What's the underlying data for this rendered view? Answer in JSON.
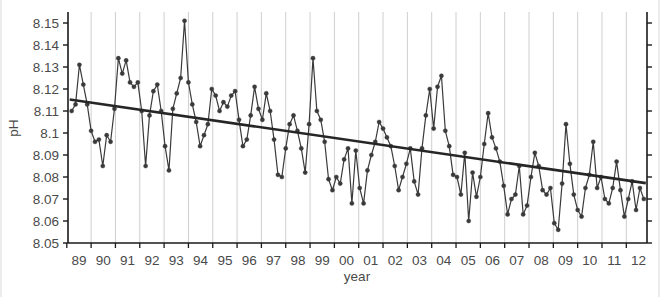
{
  "chart_data": {
    "type": "line",
    "title": "",
    "subtitle": "",
    "xlabel": "year",
    "ylabel": "pH",
    "grid": "vertical-only",
    "legend": "none",
    "xlim": [
      1988.55,
      2012.35
    ],
    "ylim": [
      8.05,
      8.155
    ],
    "ytick_labels": [
      "8.15",
      "8.14",
      "8.13",
      "8.12",
      "8.11",
      "8.1",
      "8.09",
      "8.08",
      "8.07",
      "8.06",
      "8.05"
    ],
    "ytick_values": [
      8.15,
      8.14,
      8.13,
      8.12,
      8.11,
      8.1,
      8.09,
      8.08,
      8.07,
      8.06,
      8.05
    ],
    "xtick_labels": [
      "89",
      "90",
      "91",
      "92",
      "93",
      "94",
      "95",
      "96",
      "97",
      "98",
      "99",
      "00",
      "01",
      "02",
      "03",
      "04",
      "05",
      "06",
      "07",
      "08",
      "09",
      "10",
      "11",
      "12"
    ],
    "xtick_values": [
      1989,
      1990,
      1991,
      1992,
      1993,
      1994,
      1995,
      1996,
      1997,
      1998,
      1999,
      2000,
      2001,
      2002,
      2003,
      2004,
      2005,
      2006,
      2007,
      2008,
      2009,
      2010,
      2011,
      2012
    ],
    "series": [
      {
        "name": "pH",
        "marker": "filled-circle",
        "color": "#3a3a3a",
        "x": [
          1988.7,
          1988.86,
          1989.02,
          1989.18,
          1989.34,
          1989.5,
          1989.66,
          1989.82,
          1989.98,
          1990.14,
          1990.3,
          1990.46,
          1990.62,
          1990.78,
          1990.94,
          1991.1,
          1991.26,
          1991.42,
          1991.58,
          1991.74,
          1991.9,
          1992.06,
          1992.22,
          1992.38,
          1992.54,
          1992.7,
          1992.86,
          1993.02,
          1993.18,
          1993.34,
          1993.5,
          1993.66,
          1993.82,
          1993.98,
          1994.14,
          1994.3,
          1994.46,
          1994.62,
          1994.78,
          1994.94,
          1995.1,
          1995.26,
          1995.42,
          1995.58,
          1995.74,
          1995.9,
          1996.06,
          1996.22,
          1996.38,
          1996.54,
          1996.7,
          1996.86,
          1997.02,
          1997.18,
          1997.34,
          1997.5,
          1997.66,
          1997.82,
          1997.98,
          1998.14,
          1998.3,
          1998.46,
          1998.62,
          1998.78,
          1998.94,
          1999.1,
          1999.26,
          1999.42,
          1999.58,
          1999.74,
          1999.9,
          2000.06,
          2000.22,
          2000.38,
          2000.54,
          2000.7,
          2000.86,
          2001.02,
          2001.18,
          2001.34,
          2001.5,
          2001.66,
          2001.82,
          2001.98,
          2002.14,
          2002.3,
          2002.46,
          2002.62,
          2002.78,
          2002.94,
          2003.1,
          2003.26,
          2003.42,
          2003.58,
          2003.74,
          2003.9,
          2004.06,
          2004.22,
          2004.38,
          2004.54,
          2004.7,
          2004.86,
          2005.02,
          2005.18,
          2005.34,
          2005.5,
          2005.66,
          2005.82,
          2005.98,
          2006.14,
          2006.3,
          2006.46,
          2006.62,
          2006.78,
          2006.94,
          2007.1,
          2007.26,
          2007.42,
          2007.58,
          2007.74,
          2007.9,
          2008.06,
          2008.22,
          2008.38,
          2008.54,
          2008.7,
          2008.86,
          2009.02,
          2009.18,
          2009.34,
          2009.5,
          2009.66,
          2009.82,
          2009.98,
          2010.14,
          2010.3,
          2010.46,
          2010.62,
          2010.78,
          2010.94,
          2011.1,
          2011.26,
          2011.42,
          2011.58,
          2011.74,
          2011.9,
          2012.06,
          2012.22
        ],
        "y": [
          8.11,
          8.113,
          8.131,
          8.122,
          8.113,
          8.101,
          8.096,
          8.097,
          8.085,
          8.099,
          8.096,
          8.111,
          8.134,
          8.127,
          8.133,
          8.123,
          8.121,
          8.123,
          8.11,
          8.085,
          8.108,
          8.119,
          8.122,
          8.11,
          8.094,
          8.083,
          8.111,
          8.118,
          8.125,
          8.151,
          8.123,
          8.113,
          8.105,
          8.094,
          8.099,
          8.104,
          8.12,
          8.117,
          8.11,
          8.114,
          8.112,
          8.117,
          8.119,
          8.106,
          8.094,
          8.097,
          8.108,
          8.121,
          8.111,
          8.106,
          8.118,
          8.11,
          8.097,
          8.081,
          8.08,
          8.093,
          8.104,
          8.108,
          8.101,
          8.093,
          8.082,
          8.104,
          8.134,
          8.11,
          8.106,
          8.096,
          8.079,
          8.074,
          8.08,
          8.077,
          8.088,
          8.093,
          8.068,
          8.092,
          8.075,
          8.068,
          8.083,
          8.09,
          8.096,
          8.105,
          8.102,
          8.098,
          8.094,
          8.085,
          8.074,
          8.08,
          8.086,
          8.093,
          8.078,
          8.072,
          8.093,
          8.108,
          8.12,
          8.102,
          8.121,
          8.126,
          8.101,
          8.094,
          8.081,
          8.08,
          8.072,
          8.091,
          8.06,
          8.082,
          8.071,
          8.08,
          8.095,
          8.109,
          8.098,
          8.093,
          8.087,
          8.076,
          8.063,
          8.07,
          8.072,
          8.085,
          8.063,
          8.067,
          8.08,
          8.091,
          8.085,
          8.074,
          8.072,
          8.075,
          8.059,
          8.056,
          8.077,
          8.104,
          8.086,
          8.072,
          8.065,
          8.062,
          8.075,
          8.081,
          8.096,
          8.075,
          8.08,
          8.07,
          8.068,
          8.075,
          8.087,
          8.074,
          8.062,
          8.07,
          8.078,
          8.065,
          8.075,
          8.07
        ]
      }
    ],
    "trend": {
      "name": "linear-trend",
      "color": "#262626",
      "x": [
        1988.62,
        2012.3
      ],
      "y": [
        8.1152,
        8.0772
      ],
      "slope_per_year": -0.0016
    }
  }
}
